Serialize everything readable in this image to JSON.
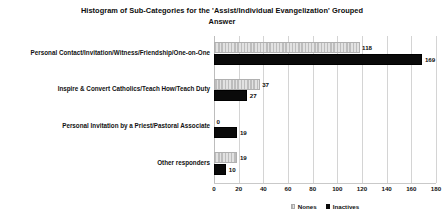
{
  "chart_data": {
    "type": "bar",
    "orientation": "horizontal",
    "title": "Histogram of Sub-Categories for the 'Assist/Individual Evangelization'  Grouped Answer",
    "title_lines": [
      "Histogram of Sub-Categories for the 'Assist/Individual Evangelization'  Grouped",
      "Answer"
    ],
    "xlabel": "",
    "ylabel": "",
    "xlim": [
      0,
      180
    ],
    "xticks": [
      0,
      20,
      40,
      60,
      80,
      100,
      120,
      140,
      160,
      180
    ],
    "xtick_labels": [
      "0",
      "20",
      "40",
      "60",
      "80",
      "100",
      "120",
      "140",
      "160",
      "180"
    ],
    "grid": true,
    "grid_axis": "x",
    "legend_position": "bottom-center",
    "categories": [
      "Personal Contact/Invitation/Witness/Friendship/One-on-One",
      "Inspire & Convert Catholics/Teach How/Teach Duty",
      "Personal Invitation by a Priest/Pastoral Associate",
      "Other responders"
    ],
    "series": [
      {
        "name": "Nones",
        "color": "#c9c9c9",
        "pattern": "hatched",
        "values": [
          118,
          37,
          0,
          19
        ],
        "labels": [
          "118",
          "37",
          "0",
          "19"
        ]
      },
      {
        "name": "Inactives",
        "color": "#0a0a0a",
        "pattern": "solid",
        "values": [
          169,
          27,
          19,
          10
        ],
        "labels": [
          "169",
          "27",
          "19",
          "10"
        ]
      }
    ]
  }
}
